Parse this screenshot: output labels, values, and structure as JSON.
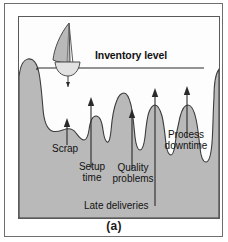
{
  "figure": {
    "caption": "(a)",
    "water_line_label": "Inventory level",
    "labels": [
      {
        "id": "scrap",
        "text": "Scrap"
      },
      {
        "id": "setup",
        "text": "Setup\ntime"
      },
      {
        "id": "quality",
        "text": "Quality\nproblems"
      },
      {
        "id": "process",
        "text": "Process\ndowntime"
      },
      {
        "id": "late",
        "text": "Late deliveries"
      }
    ],
    "label_lines": {
      "scrap": "Scrap",
      "setup_1": "Setup",
      "setup_2": "time",
      "quality_1": "Quality",
      "quality_2": "problems",
      "process_1": "Process",
      "process_2": "downtime",
      "late": "Late deliveries"
    },
    "colors": {
      "rock_fill": "#b9b9b9",
      "rock_outline": "#3c3c3c",
      "water_fill": "#fdfdfd",
      "water_line": "#2b2b2b",
      "sail_fill": "#b9b9b9",
      "hull_fill": "#e2e2e2",
      "arrow": "#2a2a2a",
      "frame": "#5a5a5a",
      "text": "#121212",
      "page_bg": "#ffffff"
    },
    "arrows": [
      {
        "id": "arrow-scrap",
        "points_to": "Scrap"
      },
      {
        "id": "arrow-setup",
        "points_to": "Setup time"
      },
      {
        "id": "arrow-quality",
        "points_to": "Quality problems"
      },
      {
        "id": "arrow-late",
        "points_to": "Late deliveries"
      },
      {
        "id": "arrow-process",
        "points_to": "Process downtime"
      }
    ],
    "icons": {
      "sailboat": "sailboat-icon"
    }
  }
}
